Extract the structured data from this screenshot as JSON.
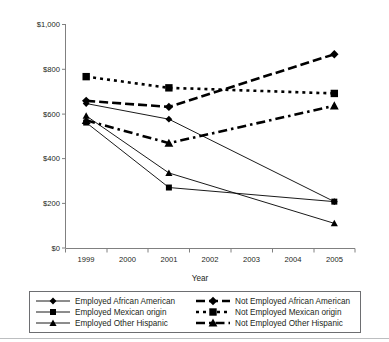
{
  "chart_data": {
    "type": "line",
    "title": "",
    "subtitle": "",
    "xlabel": "Year",
    "ylabel": "",
    "x": [
      "1999",
      "2000",
      "2001",
      "2002",
      "2003",
      "2004",
      "2005"
    ],
    "categories": [
      "1999",
      "2000",
      "2001",
      "2002",
      "2003",
      "2004",
      "2005"
    ],
    "xtick_labels": [
      "1999",
      "2000",
      "2001",
      "2002",
      "2003",
      "2004",
      "2005"
    ],
    "ytick_labels": [
      "$0",
      "$200",
      "$400",
      "$600",
      "$800",
      "$1,000"
    ],
    "ytick_values": [
      0,
      200,
      400,
      600,
      800,
      1000
    ],
    "ylim": [
      0,
      1000
    ],
    "grid": false,
    "legend_position": "bottom",
    "series": [
      {
        "name": "Employed African American",
        "marker": "diamond",
        "line_style": "solid",
        "line_width": "thin",
        "x": [
          "1999",
          "2001",
          "2005"
        ],
        "values": [
          645,
          575,
          207
        ]
      },
      {
        "name": "Employed Mexican origin",
        "marker": "square",
        "line_style": "solid",
        "line_width": "thin",
        "x": [
          "1999",
          "2001",
          "2005"
        ],
        "values": [
          560,
          270,
          207
        ]
      },
      {
        "name": "Employed Other Hispanic",
        "marker": "triangle",
        "line_style": "solid",
        "line_width": "thin",
        "x": [
          "1999",
          "2001",
          "2005"
        ],
        "values": [
          590,
          335,
          110
        ]
      },
      {
        "name": "Not Employed African American",
        "marker": "diamond",
        "line_style": "dashed",
        "line_width": "thick",
        "x": [
          "1999",
          "2001",
          "2005"
        ],
        "values": [
          657,
          630,
          865
        ]
      },
      {
        "name": "Not Employed Mexican origin",
        "marker": "square",
        "line_style": "dotted",
        "line_width": "thick",
        "x": [
          "1999",
          "2001",
          "2005"
        ],
        "values": [
          765,
          715,
          690
        ]
      },
      {
        "name": "Not Employed Other Hispanic",
        "marker": "triangle",
        "line_style": "dashdot",
        "line_width": "thick",
        "x": [
          "1999",
          "2001",
          "2005"
        ],
        "values": [
          570,
          468,
          635
        ]
      }
    ],
    "colors": {
      "series": "#000000",
      "axis": "#808080",
      "text": "#231f20",
      "legend_border": "#6d6e71",
      "background": "#ffffff"
    }
  },
  "axes": {
    "x_title": "Year",
    "y_ticks": [
      {
        "label": "$1,000",
        "value": 1000
      },
      {
        "label": "$800",
        "value": 800
      },
      {
        "label": "$600",
        "value": 600
      },
      {
        "label": "$400",
        "value": 400
      },
      {
        "label": "$200",
        "value": 200
      },
      {
        "label": "$0",
        "value": 0
      }
    ],
    "x_ticks": [
      {
        "label": "1999"
      },
      {
        "label": "2000"
      },
      {
        "label": "2001"
      },
      {
        "label": "2002"
      },
      {
        "label": "2003"
      },
      {
        "label": "2004"
      },
      {
        "label": "2005"
      }
    ]
  },
  "legend": {
    "entries": [
      {
        "label": "Employed African American",
        "marker": "diamond",
        "style": "solid",
        "column": 1
      },
      {
        "label": "Employed Mexican origin",
        "marker": "square",
        "style": "solid",
        "column": 1
      },
      {
        "label": "Employed Other Hispanic",
        "marker": "triangle",
        "style": "solid",
        "column": 1
      },
      {
        "label": "Not Employed African American",
        "marker": "diamond",
        "style": "dashed",
        "column": 2
      },
      {
        "label": "Not Employed Mexican origin",
        "marker": "square",
        "style": "dotted",
        "column": 2
      },
      {
        "label": "Not Employed Other Hispanic",
        "marker": "triangle",
        "style": "dashdot",
        "column": 2
      }
    ]
  }
}
